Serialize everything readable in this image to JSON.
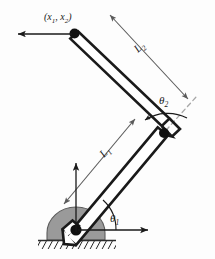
{
  "figure": {
    "type": "two-link-planar-robot-arm-diagram",
    "background_color": "#fdfdfd",
    "labels": {
      "end_effector": "(x",
      "end_effector_sub1": "1",
      "end_effector_mid": ", x",
      "end_effector_sub2": "2",
      "end_effector_close": ")",
      "link2_length": "L",
      "link2_length_sub": "2",
      "link1_length": "L",
      "link1_length_sub": "1",
      "angle2": "θ",
      "angle2_sub": "2",
      "angle1": "θ",
      "angle1_sub": "1"
    },
    "colors": {
      "link_outline": "#1a1a1a",
      "link_fill": "#ffffff",
      "joint_dot": "#111111",
      "base_mount": "#9a9a9a",
      "base_mount_outline": "#4a4a4a",
      "ground_hatch": "#2b2b2b",
      "dimension_line": "#5a5a5a",
      "centerline_dash": "#a8a8a8",
      "reference_arrow": "#1a1a1a",
      "angle_arc": "#1a1a1a"
    },
    "geometry": {
      "base_pivot": [
        76,
        230
      ],
      "elbow_joint": [
        159,
        135
      ],
      "end_effector": [
        74,
        33
      ],
      "link1_angle_deg": 48,
      "link2_angle_deg": 130,
      "link_width_px": 13
    },
    "elements": [
      {
        "name": "base-mount",
        "description": "gray semicircular pedestal"
      },
      {
        "name": "ground-hatching",
        "description": "diagonal hatch lines under base"
      },
      {
        "name": "link-1",
        "description": "lower arm rectangle from base pivot to elbow"
      },
      {
        "name": "link-2",
        "description": "upper arm rectangle from elbow to end effector"
      },
      {
        "name": "base-joint-dot",
        "description": "revolute joint at base"
      },
      {
        "name": "elbow-joint-dot",
        "description": "revolute joint at elbow"
      },
      {
        "name": "end-effector-dot",
        "description": "tip marker at end of link 2"
      },
      {
        "name": "link1-centerline",
        "description": "dashed axis of link 1 extended past elbow"
      },
      {
        "name": "theta1-arc",
        "description": "angle arc from horizontal to link 1"
      },
      {
        "name": "theta2-arc",
        "description": "angle arc from link1 extension to link 2"
      },
      {
        "name": "horizontal-reference-arrow",
        "description": "x axis arrow at base"
      },
      {
        "name": "vertical-reference-arrow",
        "description": "y axis arrow at base"
      },
      {
        "name": "diagonal-reference-arrow",
        "description": "arrow pointing down-left at base"
      },
      {
        "name": "end-effector-arrow",
        "description": "horizontal arrow pointing left from tip"
      },
      {
        "name": "L1-dimension-arrow",
        "description": "double-headed dimension arrow along link 1"
      },
      {
        "name": "L2-dimension-arrow",
        "description": "double-headed dimension arrow along link 2"
      }
    ]
  }
}
